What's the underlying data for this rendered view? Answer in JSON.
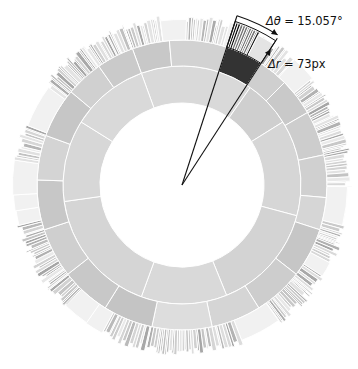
{
  "chart_data": {
    "type": "sunburst",
    "title": "",
    "center": [
      182,
      185
    ],
    "rings": [
      {
        "name": "level-1",
        "r_inner": 82,
        "r_outer": 119,
        "segments": [
          {
            "start": -20,
            "end": 35,
            "shade": "#d9d9d9"
          },
          {
            "start": 35,
            "end": 58,
            "shade": "#cfcfcf"
          },
          {
            "start": 58,
            "end": 105,
            "shade": "#d6d6d6"
          },
          {
            "start": 105,
            "end": 158,
            "shade": "#d3d3d3"
          },
          {
            "start": 158,
            "end": 200,
            "shade": "#d9d9d9"
          },
          {
            "start": 200,
            "end": 262,
            "shade": "#d5d5d5"
          },
          {
            "start": 262,
            "end": 302,
            "shade": "#d7d7d7"
          },
          {
            "start": 302,
            "end": 340,
            "shade": "#d9d9d9"
          }
        ]
      },
      {
        "name": "level-2",
        "r_inner": 119,
        "r_outer": 145,
        "segments": [
          {
            "start": -20,
            "end": -5,
            "shade": "#c8c8c8"
          },
          {
            "start": -5,
            "end": 18,
            "shade": "#d2d2d2"
          },
          {
            "start": 18,
            "end": 33,
            "shade": "#333333",
            "highlight": true
          },
          {
            "start": 33,
            "end": 45,
            "shade": "#cfcfcf"
          },
          {
            "start": 45,
            "end": 60,
            "shade": "#c9c9c9"
          },
          {
            "start": 60,
            "end": 78,
            "shade": "#cdcdcd"
          },
          {
            "start": 78,
            "end": 95,
            "shade": "#d0d0d0"
          },
          {
            "start": 95,
            "end": 108,
            "shade": "#d6d6d6"
          },
          {
            "start": 108,
            "end": 128,
            "shade": "#c6c6c6"
          },
          {
            "start": 128,
            "end": 148,
            "shade": "#cdcdcd"
          },
          {
            "start": 148,
            "end": 168,
            "shade": "#d5d5d5"
          },
          {
            "start": 168,
            "end": 192,
            "shade": "#dddddd"
          },
          {
            "start": 192,
            "end": 212,
            "shade": "#c4c4c4"
          },
          {
            "start": 212,
            "end": 232,
            "shade": "#c8c8c8"
          },
          {
            "start": 232,
            "end": 252,
            "shade": "#cfcfcf"
          },
          {
            "start": 252,
            "end": 272,
            "shade": "#c7c7c7"
          },
          {
            "start": 272,
            "end": 290,
            "shade": "#d4d4d4"
          },
          {
            "start": 290,
            "end": 310,
            "shade": "#c6c6c6"
          },
          {
            "start": 310,
            "end": 325,
            "shade": "#d0d0d0"
          },
          {
            "start": 325,
            "end": 340,
            "shade": "#cacaca"
          }
        ]
      },
      {
        "name": "level-3",
        "r_inner": 145,
        "r_outer": 171,
        "striped": true,
        "seed": 7
      }
    ],
    "annotations": {
      "wedge_start_deg": 18,
      "wedge_end_deg": 33,
      "delta_theta_label": "Δθ = 15.057°",
      "delta_r_label": "Δr = 73px",
      "delta_theta_value": 15.057,
      "delta_r_value_px": 73
    }
  },
  "labels": {
    "theta_symbol": "Δθ",
    "theta_value": " = 15.057°",
    "r_symbol": "Δr",
    "r_value": " = 73px"
  }
}
